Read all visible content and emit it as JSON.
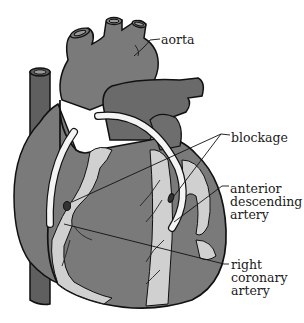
{
  "figure": {
    "colors": {
      "background": "#ffffff",
      "heart_fill": "#7a7a7a",
      "vessel_dark": "#5f5f5f",
      "artery_light": "#d0d0d0",
      "graft": "#f4f4f4",
      "outline": "#111111"
    }
  },
  "labels": {
    "aorta": "aorta",
    "blockage": "blockage",
    "anterior_descending_artery": "anterior\ndescending\nartery",
    "right_coronary_artery": "right\ncoronary\nartery"
  }
}
